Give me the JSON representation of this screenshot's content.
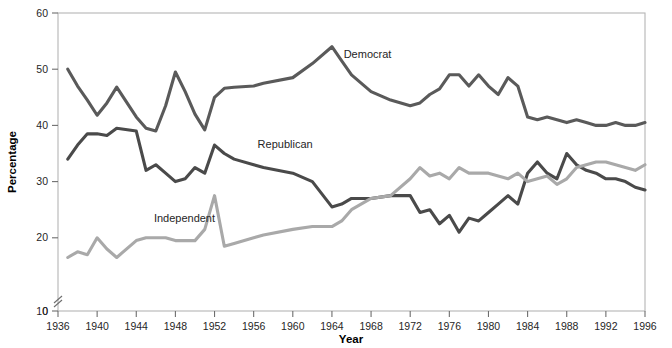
{
  "chart_data": {
    "type": "line",
    "title": "",
    "xlabel": "Year",
    "ylabel": "Percentage",
    "xlim": [
      1936,
      1996
    ],
    "ylim": [
      0,
      60
    ],
    "y_axis_break": true,
    "y_break_between": [
      0,
      10
    ],
    "grid": false,
    "legend_position": "inline-annotations",
    "xticks": [
      1936,
      1940,
      1944,
      1948,
      1952,
      1956,
      1960,
      1964,
      1968,
      1972,
      1976,
      1980,
      1984,
      1988,
      1992,
      1996
    ],
    "yticks": [
      0,
      10,
      20,
      30,
      40,
      50,
      60
    ],
    "series": [
      {
        "name": "Democrat",
        "color": "#5a5a5a",
        "label_x": 1965.2,
        "label_y": 52.0,
        "x": [
          1937,
          1938,
          1939,
          1940,
          1941,
          1942,
          1944,
          1945,
          1946,
          1947,
          1948,
          1949,
          1950,
          1951,
          1952,
          1953,
          1954,
          1956,
          1957,
          1960,
          1962,
          1964,
          1965,
          1966,
          1968,
          1970,
          1972,
          1973,
          1974,
          1975,
          1976,
          1977,
          1978,
          1979,
          1980,
          1981,
          1982,
          1983,
          1984,
          1985,
          1986,
          1987,
          1988,
          1989,
          1990,
          1991,
          1992,
          1993,
          1994,
          1995,
          1996
        ],
        "y": [
          50.0,
          47.0,
          44.5,
          41.8,
          44.0,
          46.8,
          41.5,
          39.5,
          39.0,
          43.5,
          49.5,
          46.0,
          42.0,
          39.2,
          45.0,
          46.6,
          46.8,
          47.0,
          47.5,
          48.5,
          51.0,
          54.0,
          51.5,
          49.0,
          46.0,
          44.5,
          43.5,
          44.0,
          45.5,
          46.5,
          49.0,
          49.0,
          47.0,
          49.0,
          47.0,
          45.5,
          48.5,
          47.0,
          41.5,
          41.0,
          41.5,
          41.0,
          40.5,
          41.0,
          40.5,
          40.0,
          40.0,
          40.5,
          40.0,
          40.0,
          40.5
        ]
      },
      {
        "name": "Republican",
        "color": "#4a4a4a",
        "label_x": 1956.4,
        "label_y": 36.0,
        "x": [
          1937,
          1938,
          1939,
          1940,
          1941,
          1942,
          1944,
          1945,
          1946,
          1947,
          1948,
          1949,
          1950,
          1951,
          1952,
          1953,
          1954,
          1956,
          1957,
          1960,
          1962,
          1964,
          1965,
          1966,
          1968,
          1970,
          1972,
          1973,
          1974,
          1975,
          1976,
          1977,
          1978,
          1979,
          1980,
          1981,
          1982,
          1983,
          1984,
          1985,
          1986,
          1987,
          1988,
          1989,
          1990,
          1991,
          1992,
          1993,
          1994,
          1995,
          1996
        ],
        "y": [
          34.0,
          36.5,
          38.5,
          38.5,
          38.2,
          39.5,
          39.0,
          32.0,
          33.0,
          31.5,
          30.0,
          30.5,
          32.5,
          31.5,
          36.5,
          35.0,
          34.0,
          33.0,
          32.5,
          31.5,
          30.0,
          25.5,
          26.0,
          27.0,
          27.0,
          27.5,
          27.5,
          24.5,
          25.0,
          22.5,
          24.0,
          21.0,
          23.5,
          23.0,
          24.5,
          26.0,
          27.5,
          26.0,
          31.5,
          33.5,
          31.5,
          30.5,
          35.0,
          33.0,
          32.0,
          31.5,
          30.5,
          30.5,
          30.0,
          29.0,
          28.5
        ]
      },
      {
        "name": "Independent",
        "color": "#a9a9a9",
        "label_x": 1945.8,
        "label_y": 22.8,
        "x": [
          1937,
          1938,
          1939,
          1940,
          1941,
          1942,
          1944,
          1945,
          1946,
          1947,
          1948,
          1949,
          1950,
          1951,
          1952,
          1953,
          1954,
          1956,
          1957,
          1960,
          1962,
          1964,
          1965,
          1966,
          1968,
          1970,
          1972,
          1973,
          1974,
          1975,
          1976,
          1977,
          1978,
          1979,
          1980,
          1981,
          1982,
          1983,
          1984,
          1985,
          1986,
          1987,
          1988,
          1989,
          1990,
          1991,
          1992,
          1993,
          1994,
          1995,
          1996
        ],
        "y": [
          16.5,
          17.5,
          17.0,
          20.0,
          18.0,
          16.5,
          19.5,
          20.0,
          20.0,
          20.0,
          19.5,
          19.5,
          19.5,
          21.5,
          27.5,
          18.5,
          19.0,
          20.0,
          20.5,
          21.5,
          22.0,
          22.0,
          23.0,
          25.0,
          27.0,
          27.5,
          30.5,
          32.5,
          31.0,
          31.5,
          30.5,
          32.5,
          31.5,
          31.5,
          31.5,
          31.0,
          30.5,
          31.5,
          30.0,
          30.5,
          31.0,
          29.5,
          30.5,
          32.5,
          33.0,
          33.5,
          33.5,
          33.0,
          32.5,
          32.0,
          33.0
        ]
      }
    ]
  }
}
